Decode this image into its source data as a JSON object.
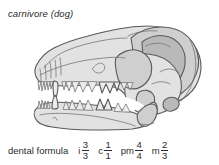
{
  "figure": {
    "title": "carnivore (dog)",
    "illustration_alt": "lateral view line drawing of a dog skull with upper and lower jaws and teeth"
  },
  "dental_formula": {
    "label": "dental formula",
    "terms": [
      {
        "symbol": "i",
        "numerator": "3",
        "denominator": "3"
      },
      {
        "symbol": "c",
        "numerator": "1",
        "denominator": "1"
      },
      {
        "symbol": "pm",
        "numerator": "4",
        "denominator": "4"
      },
      {
        "symbol": "m",
        "numerator": "2",
        "denominator": "3"
      }
    ]
  },
  "colors": {
    "background": "#ffffff",
    "text": "#2b2b2b",
    "outline": "#5a5a5a",
    "fill_light": "#e2e2e2",
    "fill_mid": "#cfcfcf",
    "fill_dark": "#b9b9b9",
    "fill_deep": "#a6a6a6"
  }
}
